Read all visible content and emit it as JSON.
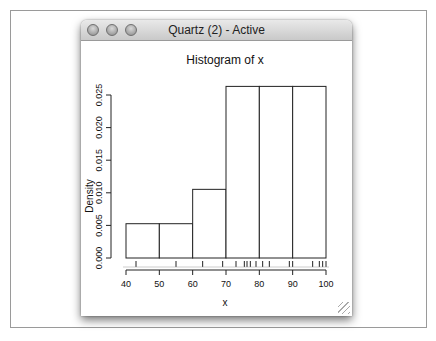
{
  "window": {
    "title": "Quartz (2) - Active",
    "buttons": [
      "close",
      "minimize",
      "zoom"
    ]
  },
  "chart_data": {
    "type": "bar",
    "title": "Histogram of x",
    "xlabel": "x",
    "ylabel": "Density",
    "bins": [
      [
        40,
        50
      ],
      [
        50,
        60
      ],
      [
        60,
        70
      ],
      [
        70,
        80
      ],
      [
        80,
        90
      ],
      [
        90,
        100
      ]
    ],
    "values": [
      0.00526,
      0.00526,
      0.01053,
      0.02632,
      0.02632,
      0.02632
    ],
    "xlim": [
      40,
      100
    ],
    "ylim": [
      0,
      0.025
    ],
    "xticks": [
      40,
      50,
      60,
      70,
      80,
      90,
      100
    ],
    "xtick_labels": [
      "40",
      "50",
      "60",
      "70",
      "80",
      "90",
      "100"
    ],
    "yticks": [
      0,
      0.005,
      0.01,
      0.015,
      0.02,
      0.025
    ],
    "ytick_labels": [
      "0.000",
      "0.005",
      "0.010",
      "0.015",
      "0.020",
      "0.025"
    ],
    "rug": [
      43,
      55,
      63,
      69,
      73,
      75.5,
      76.3,
      77.3,
      79,
      81,
      83,
      89,
      90,
      96,
      98,
      99,
      100
    ],
    "grid": false,
    "legend": "none"
  }
}
